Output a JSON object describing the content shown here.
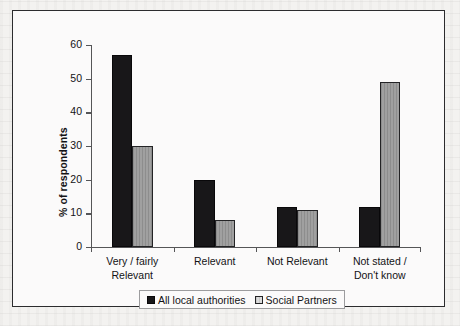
{
  "chart_data": {
    "type": "bar",
    "title": "",
    "subtitle": "",
    "xlabel": "",
    "ylabel": "% of respondents",
    "ylim": [
      0,
      60
    ],
    "yticks": [
      0,
      10,
      20,
      30,
      40,
      50,
      60
    ],
    "ytick_labels": [
      "0",
      "10",
      "20",
      "30",
      "40",
      "50",
      "60"
    ],
    "grid": false,
    "legend_position": "bottom",
    "categories": [
      "Very / fairly\nRelevant",
      "Relevant",
      "Not Relevant",
      "Not stated /\nDon't know"
    ],
    "series": [
      {
        "name": "All local authorities",
        "color": "#181719",
        "values": [
          57,
          20,
          12,
          12
        ]
      },
      {
        "name": "Social Partners",
        "color": "#9a9a9a",
        "values": [
          30,
          8,
          11,
          49
        ]
      }
    ]
  },
  "legend": {
    "entries": [
      {
        "label": "All local authorities"
      },
      {
        "label": "Social Partners"
      }
    ]
  },
  "colors": {
    "series_a": "#181719",
    "series_b": "#9a9a9a",
    "frame": "#2c2c2e",
    "axis": "#555557",
    "page_background": "#f3f2f0",
    "figure_background": "#fbfafa"
  }
}
